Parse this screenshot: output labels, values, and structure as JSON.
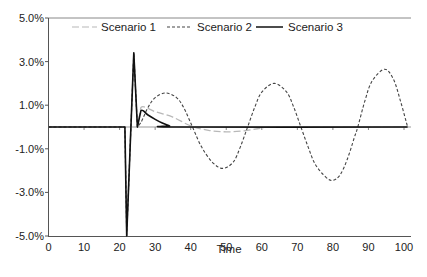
{
  "chart_data": {
    "type": "line",
    "title": "",
    "xlabel": "Time",
    "ylabel": "",
    "xlim": [
      0,
      101
    ],
    "ylim": [
      -5.0,
      5.0
    ],
    "x_ticks": [
      0,
      10,
      20,
      30,
      40,
      50,
      60,
      70,
      80,
      90,
      100
    ],
    "y_ticks": [
      5.0,
      3.0,
      1.0,
      -1.0,
      -3.0,
      -5.0
    ],
    "y_tick_labels": [
      "5.0%",
      "3.0%",
      "1.0%",
      "-1.0%",
      "-3.0%",
      "-5.0%"
    ],
    "grid": false,
    "legend_position": "top",
    "series": [
      {
        "name": "Scenario 1",
        "style": "long-dash",
        "color": "#b8b8b8",
        "points": [
          [
            0,
            0
          ],
          [
            21.5,
            0
          ],
          [
            22,
            -5.0
          ],
          [
            24,
            3.4
          ],
          [
            25,
            0.0
          ],
          [
            26,
            0.9
          ],
          [
            30,
            0.7
          ],
          [
            35,
            0.45
          ],
          [
            40,
            0.05
          ],
          [
            45,
            -0.15
          ],
          [
            50,
            -0.22
          ],
          [
            55,
            -0.18
          ],
          [
            60,
            -0.05
          ],
          [
            65,
            0
          ],
          [
            101,
            0
          ]
        ]
      },
      {
        "name": "Scenario 2",
        "style": "short-dash",
        "color": "#444444",
        "points": [
          [
            0,
            0
          ],
          [
            21.5,
            0
          ],
          [
            22,
            -5.0
          ],
          [
            24,
            3.4
          ],
          [
            25,
            0.0
          ],
          [
            26,
            0.2
          ],
          [
            28,
            0.9
          ],
          [
            30,
            1.35
          ],
          [
            33,
            1.56
          ],
          [
            36,
            1.35
          ],
          [
            38,
            0.9
          ],
          [
            40.5,
            0
          ],
          [
            43,
            -0.9
          ],
          [
            46,
            -1.6
          ],
          [
            49,
            -1.9
          ],
          [
            52,
            -1.6
          ],
          [
            54,
            -0.9
          ],
          [
            56,
            0
          ],
          [
            58,
            0.9
          ],
          [
            60,
            1.6
          ],
          [
            63.5,
            2.0
          ],
          [
            67,
            1.6
          ],
          [
            69,
            0.9
          ],
          [
            71,
            0
          ],
          [
            73,
            -0.9
          ],
          [
            75,
            -1.7
          ],
          [
            78,
            -2.3
          ],
          [
            80,
            -2.45
          ],
          [
            82,
            -2.2
          ],
          [
            84,
            -1.5
          ],
          [
            86,
            -0.5
          ],
          [
            87,
            0
          ],
          [
            89,
            1.2
          ],
          [
            91,
            2.1
          ],
          [
            94.5,
            2.65
          ],
          [
            97,
            2.2
          ],
          [
            99,
            1.2
          ],
          [
            101,
            0
          ]
        ]
      },
      {
        "name": "Scenario 3",
        "style": "solid",
        "color": "#111111",
        "points": [
          [
            0,
            0
          ],
          [
            21.5,
            0
          ],
          [
            22,
            -5.0
          ],
          [
            24,
            3.4
          ],
          [
            25,
            0.0
          ],
          [
            26,
            0.75
          ],
          [
            28,
            0.55
          ],
          [
            30,
            0.35
          ],
          [
            32,
            0.18
          ],
          [
            34,
            0.06
          ],
          [
            36,
            0
          ],
          [
            101,
            0
          ]
        ]
      }
    ]
  },
  "legend": {
    "items": [
      {
        "label": "Scenario 1"
      },
      {
        "label": "Scenario 2"
      },
      {
        "label": "Scenario 3"
      }
    ]
  },
  "axes": {
    "x_title": "Time",
    "x_tick_labels": [
      "0",
      "10",
      "20",
      "30",
      "40",
      "50",
      "60",
      "70",
      "80",
      "90",
      "100"
    ],
    "y_tick_labels": [
      "5.0%",
      "3.0%",
      "1.0%",
      "-1.0%",
      "-3.0%",
      "-5.0%"
    ]
  }
}
